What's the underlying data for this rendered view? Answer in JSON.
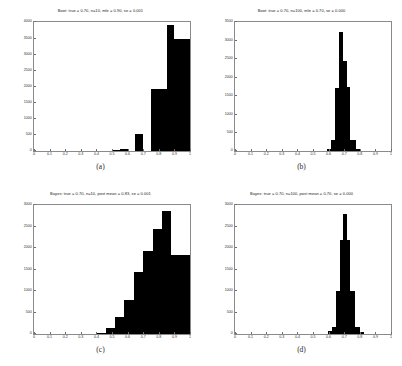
{
  "figure": {
    "background": "#ffffff",
    "bar_color": "#000000",
    "axis_color": "#8a8a8a",
    "text_color": "#2b2b2b"
  },
  "panels": [
    {
      "key": "a",
      "caption": "(a)",
      "title": "Boot: true = 0.70, n=10, mle = 0.90, se = 0.001",
      "chart_data": {
        "type": "bar",
        "title": "Boot: true = 0.70, n=10, mle = 0.90, se = 0.001",
        "xlabel": "",
        "ylabel": "",
        "xlim": [
          0,
          1
        ],
        "ylim": [
          0,
          4000
        ],
        "grid": false,
        "legend": "none",
        "xticks": [
          "0",
          "0.1",
          "0.2",
          "0.3",
          "0.4",
          "0.5",
          "0.6",
          "0.7",
          "0.8",
          "0.9",
          "1"
        ],
        "xtickvals": [
          0,
          0.1,
          0.2,
          0.3,
          0.4,
          0.5,
          0.6,
          0.7,
          0.8,
          0.9,
          1
        ],
        "yticks": [
          "0",
          "500",
          "1000",
          "1500",
          "2000",
          "2500",
          "3000",
          "3500",
          "4000"
        ],
        "ytickvals": [
          0,
          500,
          1000,
          1500,
          2000,
          2500,
          3000,
          3500,
          4000
        ],
        "bins": [
          {
            "x0": 0.5,
            "x1": 0.55,
            "value": 20
          },
          {
            "x0": 0.55,
            "x1": 0.6,
            "value": 75
          },
          {
            "x0": 0.65,
            "x1": 0.7,
            "value": 520
          },
          {
            "x0": 0.75,
            "x1": 0.85,
            "value": 1930
          },
          {
            "x0": 0.85,
            "x1": 0.9,
            "value": 3900
          },
          {
            "x0": 0.9,
            "x1": 1.0,
            "value": 3460
          }
        ]
      }
    },
    {
      "key": "b",
      "caption": "(b)",
      "title": "Boot: true = 0.70, n=100, mle = 0.70, se = 0.000",
      "chart_data": {
        "type": "bar",
        "title": "Boot: true = 0.70, n=100, mle = 0.70, se = 0.000",
        "xlabel": "",
        "ylabel": "",
        "xlim": [
          0,
          1
        ],
        "ylim": [
          0,
          3500
        ],
        "grid": false,
        "legend": "none",
        "xticks": [
          "0",
          "0.1",
          "0.2",
          "0.3",
          "0.4",
          "0.5",
          "0.6",
          "0.7",
          "0.8",
          "0.9",
          "1"
        ],
        "xtickvals": [
          0,
          0.1,
          0.2,
          0.3,
          0.4,
          0.5,
          0.6,
          0.7,
          0.8,
          0.9,
          1
        ],
        "yticks": [
          "0",
          "500",
          "1000",
          "1500",
          "2000",
          "2500",
          "3000",
          "3500"
        ],
        "ytickvals": [
          0,
          500,
          1000,
          1500,
          2000,
          2500,
          3000,
          3500
        ],
        "bins": [
          {
            "x0": 0.59,
            "x1": 0.615,
            "value": 60
          },
          {
            "x0": 0.615,
            "x1": 0.64,
            "value": 290
          },
          {
            "x0": 0.64,
            "x1": 0.665,
            "value": 1720
          },
          {
            "x0": 0.665,
            "x1": 0.69,
            "value": 3230
          },
          {
            "x0": 0.69,
            "x1": 0.715,
            "value": 2430
          },
          {
            "x0": 0.715,
            "x1": 0.74,
            "value": 1740
          },
          {
            "x0": 0.74,
            "x1": 0.775,
            "value": 290
          },
          {
            "x0": 0.775,
            "x1": 0.8,
            "value": 60
          }
        ]
      }
    },
    {
      "key": "c",
      "caption": "(c)",
      "title": "Bayes: true = 0.70, n=10, post mean = 0.83, se = 0.001",
      "chart_data": {
        "type": "bar",
        "title": "Bayes: true = 0.70, n=10, post mean = 0.83, se = 0.001",
        "xlabel": "",
        "ylabel": "",
        "xlim": [
          0,
          1
        ],
        "ylim": [
          0,
          3000
        ],
        "grid": false,
        "legend": "none",
        "xticks": [
          "0",
          "0.1",
          "0.2",
          "0.3",
          "0.4",
          "0.5",
          "0.6",
          "0.7",
          "0.8",
          "0.9",
          "1"
        ],
        "xtickvals": [
          0,
          0.1,
          0.2,
          0.3,
          0.4,
          0.5,
          0.6,
          0.7,
          0.8,
          0.9,
          1
        ],
        "yticks": [
          "0",
          "500",
          "1000",
          "1500",
          "2000",
          "2500",
          "3000"
        ],
        "ytickvals": [
          0,
          500,
          1000,
          1500,
          2000,
          2500,
          3000
        ],
        "bins": [
          {
            "x0": 0.4,
            "x1": 0.46,
            "value": 30
          },
          {
            "x0": 0.46,
            "x1": 0.52,
            "value": 130
          },
          {
            "x0": 0.52,
            "x1": 0.58,
            "value": 390
          },
          {
            "x0": 0.58,
            "x1": 0.64,
            "value": 790
          },
          {
            "x0": 0.64,
            "x1": 0.7,
            "value": 1440
          },
          {
            "x0": 0.7,
            "x1": 0.76,
            "value": 1940
          },
          {
            "x0": 0.76,
            "x1": 0.82,
            "value": 2440
          },
          {
            "x0": 0.82,
            "x1": 0.88,
            "value": 2870
          },
          {
            "x0": 0.88,
            "x1": 1.0,
            "value": 1830
          }
        ]
      }
    },
    {
      "key": "d",
      "caption": "(d)",
      "title": "Bayes: true = 0.70, n=100, post mean = 0.70, se = 0.000",
      "chart_data": {
        "type": "bar",
        "title": "Bayes: true = 0.70, n=100, post mean = 0.70, se = 0.000",
        "xlabel": "",
        "ylabel": "",
        "xlim": [
          0,
          1
        ],
        "ylim": [
          0,
          3000
        ],
        "grid": false,
        "legend": "none",
        "xticks": [
          "0",
          "0.1",
          "0.2",
          "0.3",
          "0.4",
          "0.5",
          "0.6",
          "0.7",
          "0.8",
          "0.9",
          "1"
        ],
        "xtickvals": [
          0,
          0.1,
          0.2,
          0.3,
          0.4,
          0.5,
          0.6,
          0.7,
          0.8,
          0.9,
          1
        ],
        "yticks": [
          "0",
          "500",
          "1000",
          "1500",
          "2000",
          "2500",
          "3000"
        ],
        "ytickvals": [
          0,
          500,
          1000,
          1500,
          2000,
          2500,
          3000
        ],
        "bins": [
          {
            "x0": 0.595,
            "x1": 0.62,
            "value": 60
          },
          {
            "x0": 0.62,
            "x1": 0.645,
            "value": 170
          },
          {
            "x0": 0.645,
            "x1": 0.67,
            "value": 1010
          },
          {
            "x0": 0.67,
            "x1": 0.695,
            "value": 2190
          },
          {
            "x0": 0.695,
            "x1": 0.715,
            "value": 2790
          },
          {
            "x0": 0.715,
            "x1": 0.74,
            "value": 2180
          },
          {
            "x0": 0.74,
            "x1": 0.77,
            "value": 1010
          },
          {
            "x0": 0.77,
            "x1": 0.8,
            "value": 170
          },
          {
            "x0": 0.8,
            "x1": 0.825,
            "value": 40
          }
        ]
      }
    }
  ]
}
